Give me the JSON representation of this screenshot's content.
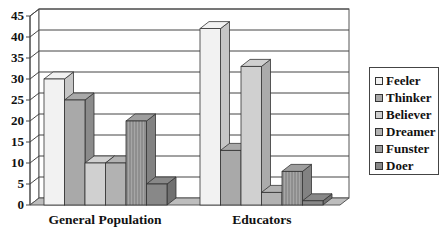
{
  "chart_data": {
    "type": "bar",
    "title": "",
    "xlabel": "",
    "ylabel": "",
    "categories": [
      "General Population",
      "Educators"
    ],
    "series": [
      {
        "name": "Feeler",
        "values": [
          30,
          42
        ],
        "color": "#f2f2f2"
      },
      {
        "name": "Thinker",
        "values": [
          25,
          13
        ],
        "color": "#a9a9a9"
      },
      {
        "name": "Believer",
        "values": [
          10,
          33
        ],
        "color": "#d0d0d0"
      },
      {
        "name": "Dreamer",
        "values": [
          10,
          3
        ],
        "color": "#b2b2b2"
      },
      {
        "name": "Funster",
        "values": [
          20,
          8
        ],
        "color": "#9e9e9e"
      },
      {
        "name": "Doer",
        "values": [
          5,
          1
        ],
        "color": "#888888"
      }
    ],
    "ylim": [
      0,
      45
    ],
    "yticks": [
      0,
      5,
      10,
      15,
      20,
      25,
      30,
      35,
      40,
      45
    ],
    "grid": true,
    "style": "3d-clustered-column",
    "legend_position": "right"
  },
  "legend": {
    "items": [
      "Feeler",
      "Thinker",
      "Believer",
      "Dreamer",
      "Funster",
      "Doer"
    ]
  }
}
